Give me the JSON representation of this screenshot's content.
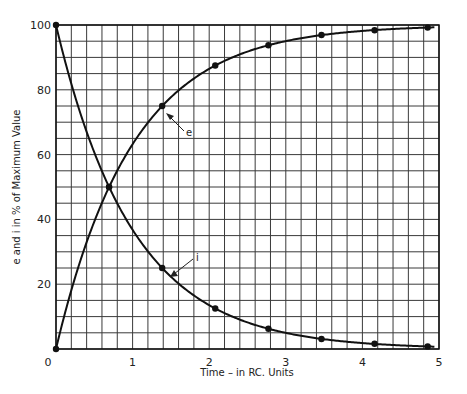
{
  "chart_data": {
    "type": "line",
    "title": "",
    "xlabel": "Time – in RC. Units",
    "ylabel": "e and i in % of Maximum Value",
    "xlim": [
      0,
      5
    ],
    "ylim": [
      0,
      100
    ],
    "xticks": [
      "0",
      "1",
      "2",
      "3",
      "4",
      "5"
    ],
    "yticks": [
      "20",
      "40",
      "60",
      "80",
      "100"
    ],
    "grid": true,
    "grid_minor_x": 0.2,
    "grid_minor_y": 5,
    "x": [
      0,
      0.693,
      1.386,
      2.079,
      2.773,
      3.466,
      4.159,
      4.852
    ],
    "series": [
      {
        "name": "e",
        "values": [
          0,
          50,
          75,
          87.5,
          93.75,
          96.9,
          98.4,
          99.2
        ],
        "annotation": "e"
      },
      {
        "name": "i",
        "values": [
          100,
          50,
          25,
          12.5,
          6.25,
          3.1,
          1.6,
          0.8
        ],
        "annotation": "i"
      }
    ],
    "legend": null
  },
  "labels": {
    "xlabel": "Time – in RC. Units",
    "ylabel": "e and i in % of Maximum Value",
    "e_annotation": "e",
    "i_annotation": "i",
    "origin": "0"
  }
}
